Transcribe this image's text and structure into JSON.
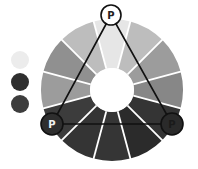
{
  "diagram": {
    "wheel": {
      "center": [
        112,
        90
      ],
      "outer_radius": 71,
      "inner_radius": 22,
      "start_angle_deg": -105,
      "separator_color": "#ffffff",
      "segments": [
        {
          "position": "top",
          "color": "#e6e6e6"
        },
        {
          "position": "top-right-1",
          "color": "#bdbdbd"
        },
        {
          "position": "top-right-2",
          "color": "#9c9c9c"
        },
        {
          "position": "right",
          "color": "#878787"
        },
        {
          "position": "bottom-right-1",
          "color": "#343434"
        },
        {
          "position": "bottom-right-2",
          "color": "#2b2b2b"
        },
        {
          "position": "bottom",
          "color": "#353535"
        },
        {
          "position": "bottom-left-1",
          "color": "#343434"
        },
        {
          "position": "bottom-left-2",
          "color": "#3c3c3c"
        },
        {
          "position": "left",
          "color": "#9c9c9c"
        },
        {
          "position": "top-left-1",
          "color": "#909090"
        },
        {
          "position": "top-left-2",
          "color": "#bdbdbd"
        }
      ]
    },
    "triangle": {
      "stroke": "#111111",
      "points": [
        [
          111,
          15
        ],
        [
          52,
          124
        ],
        [
          172,
          124
        ]
      ]
    },
    "primaries": [
      {
        "label": "P",
        "cx": 111,
        "cy": 15,
        "r": 10,
        "fill": "#ffffff",
        "text_color": "#222222"
      },
      {
        "label": "P",
        "cx": 52,
        "cy": 124,
        "r": 11,
        "fill": "#2e2e2e",
        "text_color": "#f0f0f0"
      },
      {
        "label": "P",
        "cx": 172,
        "cy": 124,
        "r": 11,
        "fill": "#2a2a2a",
        "text_color": "#1a1a1a"
      }
    ],
    "swatches": [
      {
        "cx": 20,
        "cy": 60,
        "r": 9,
        "color": "#ececec"
      },
      {
        "cx": 20,
        "cy": 82,
        "r": 9,
        "color": "#2f2f2f"
      },
      {
        "cx": 20,
        "cy": 104,
        "r": 9,
        "color": "#3d3d3d"
      }
    ]
  }
}
